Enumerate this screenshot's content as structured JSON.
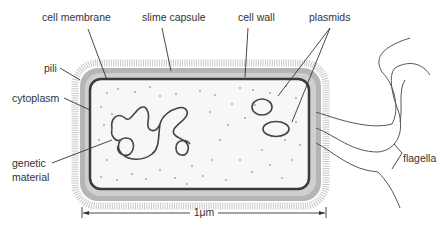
{
  "labels": {
    "cell_membrane": "cell membrane",
    "slime_capsule": "slime capsule",
    "cell_wall": "cell wall",
    "plasmids": "plasmids",
    "pili": "pili",
    "cytoplasm": "cytoplasm",
    "genetic_line1": "genetic",
    "genetic_line2": "material",
    "flagella": "flagella"
  },
  "scale_bar": {
    "label": "1μm"
  },
  "colors": {
    "capsule": "#b5b5b5",
    "cell_wall": "#d4d4d4",
    "membrane": "#3a3a3a",
    "cytoplasm": "#f7f7f7",
    "outline": "#444444",
    "leader": "#333333",
    "text": "#333333",
    "dots": "#a8a8a8"
  }
}
